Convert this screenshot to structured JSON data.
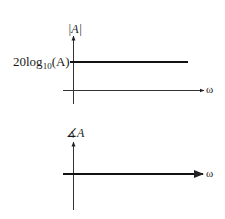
{
  "diagram": {
    "type": "bode-plot-sketch",
    "colors": {
      "background": "#ffffff",
      "axis": "#333333",
      "curve": "#111111",
      "text": "#1a1a1a"
    },
    "magnitude_plot": {
      "y_axis_label": "|A|",
      "x_axis_label": "ω",
      "level_label_main": "20log",
      "level_label_sub": "10",
      "level_label_tail": "(A)",
      "curve": "horizontal line at constant magnitude 20log10(A)"
    },
    "phase_plot": {
      "y_axis_label": "∡A",
      "x_axis_label": "ω",
      "curve": "horizontal line at zero phase (on ω axis)"
    }
  }
}
